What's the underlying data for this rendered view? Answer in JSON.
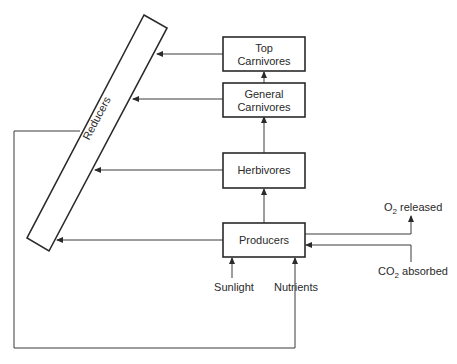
{
  "diagram": {
    "type": "ecosystem energy/matter flow",
    "nodes": {
      "top_carnivores": {
        "line1": "Top",
        "line2": "Carnivores"
      },
      "general_carnivores": {
        "line1": "General",
        "line2": "Carnivores"
      },
      "herbivores": {
        "label": "Herbivores"
      },
      "producers": {
        "label": "Producers"
      },
      "reducers": {
        "label": "Reducers"
      }
    },
    "inputs": {
      "sunlight": "Sunlight",
      "nutrients": "Nutrients",
      "co2": {
        "prefix": "CO",
        "sub": "2",
        "suffix": " absorbed"
      },
      "o2": {
        "prefix": "O",
        "sub": "2",
        "suffix": " released"
      }
    },
    "edges": [
      {
        "from": "Producers",
        "to": "Herbivores"
      },
      {
        "from": "Herbivores",
        "to": "General Carnivores"
      },
      {
        "from": "General Carnivores",
        "to": "Top Carnivores"
      },
      {
        "from": "Top Carnivores",
        "to": "Reducers"
      },
      {
        "from": "General Carnivores",
        "to": "Reducers"
      },
      {
        "from": "Herbivores",
        "to": "Reducers"
      },
      {
        "from": "Producers",
        "to": "Reducers"
      },
      {
        "from": "Reducers",
        "to": "Nutrients"
      },
      {
        "from": "Nutrients",
        "to": "Producers"
      },
      {
        "from": "Sunlight",
        "to": "Producers"
      },
      {
        "from": "CO2 absorbed",
        "to": "Producers"
      },
      {
        "from": "Producers",
        "to": "O2 released"
      }
    ]
  }
}
